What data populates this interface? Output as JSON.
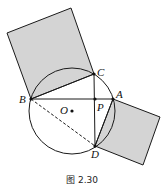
{
  "figure": {
    "caption": "图 2.30",
    "colors": {
      "fill": "#d4d4d4",
      "stroke": "#1a1a1a"
    },
    "points": {
      "A": {
        "label": "A",
        "x": 113,
        "y": 99
      },
      "B": {
        "label": "B",
        "x": 31,
        "y": 99
      },
      "C": {
        "label": "C",
        "x": 94,
        "y": 74
      },
      "D": {
        "label": "D",
        "x": 95,
        "y": 146
      },
      "P": {
        "label": "P",
        "x": 95,
        "y": 99
      },
      "O": {
        "label": "O",
        "x": 72,
        "y": 111
      }
    },
    "circle": {
      "cx": 72,
      "cy": 111,
      "r": 43
    }
  }
}
